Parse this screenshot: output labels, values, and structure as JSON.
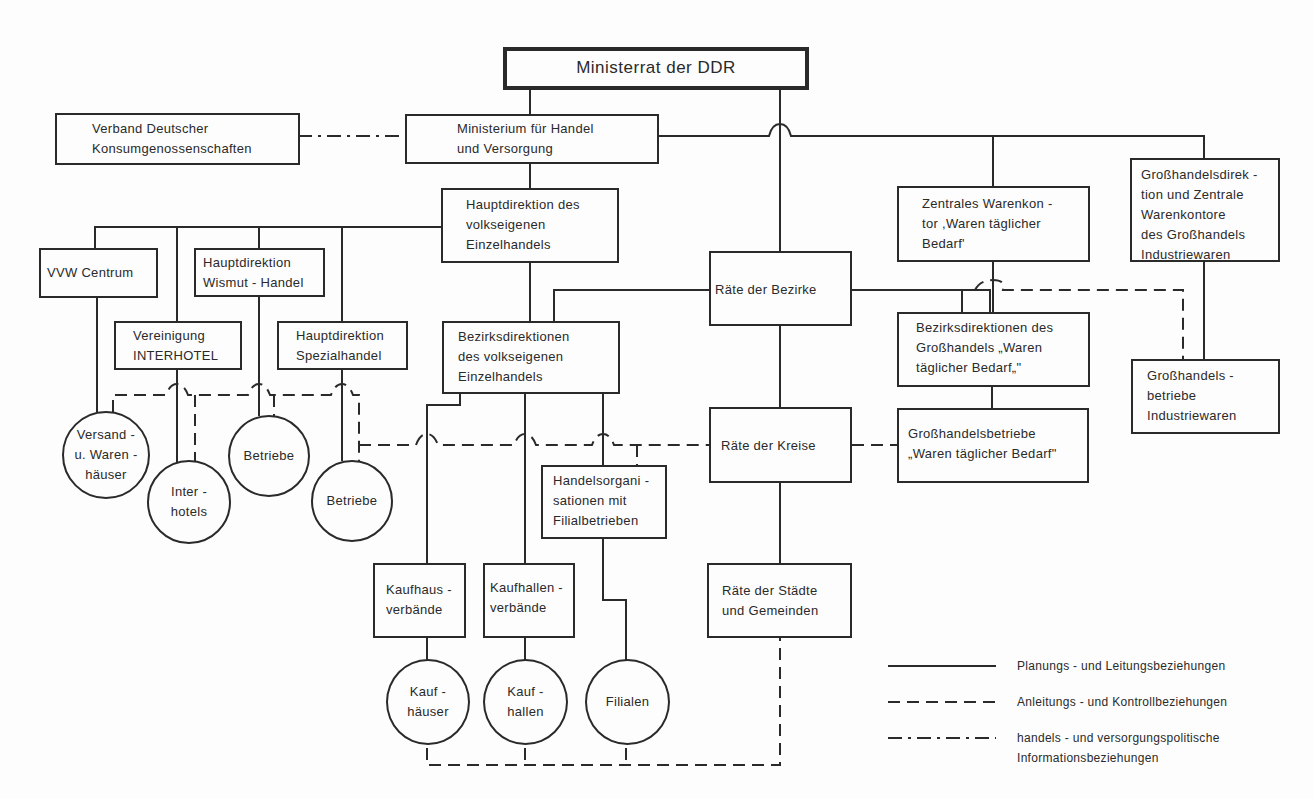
{
  "title": "Ministerrat der DDR",
  "nodes": {
    "ministerrat": "Ministerrat der DDR",
    "verband": "Verband Deutscher\nKonsumgenossenschaften",
    "ministerium": "Ministerium für Handel\nund Versorgung",
    "hauptdirektion_ve": "Hauptdirektion des\nvolkseigenen\nEinzelhandels",
    "vvw_centrum": "VVW Centrum",
    "hd_wismut": "Hauptdirektion\nWismut - Handel",
    "interhotel": "Vereinigung\nINTERHOTEL",
    "hd_spezial": "Hauptdirektion\nSpezialhandel",
    "bezirksdir_ve": "Bezirksdirektionen\ndes volkseigenen\nEinzelhandels",
    "raete_bezirke": "Räte der Bezirke",
    "raete_kreise": "Räte der Kreise",
    "raete_staedte": "Räte der Städte\nund Gemeinden",
    "zentrales_warenkontor": "Zentrales Warenkon -\ntor ,Waren täglicher\nBedarf'",
    "ghd_industrie": "Großhandelsdirek -\ntion und Zentrale\nWarenkontore\ndes Großhandels\nIndustriewaren",
    "bezirksdir_gh": "Bezirksdirektionen des\nGroßhandels „Waren\ntäglicher Bedarf„\"",
    "ghb_wtb": "Großhandelsbetriebe\n„Waren täglicher Bedarf\"",
    "ghb_industrie": "Großhandels -\nbetriebe\nIndustriewaren",
    "handelsorg": "Handelsorgani -\nsationen mit\nFilialbetrieben",
    "kaufhausverbaende": "Kaufhaus -\nverbände",
    "kaufhallenverbaende": "Kaufhallen -\nverbände"
  },
  "circles": {
    "versand": "Versand -\nu. Waren -\nhäuser",
    "interhotels": "Inter -\nhotels",
    "betriebe_wismut": "Betriebe",
    "betriebe_spezial": "Betriebe",
    "kaufhaeuser": "Kauf -\nhäuser",
    "kaufhallen": "Kauf -\nhallen",
    "filialen": "Filialen"
  },
  "legend": [
    {
      "style": "solid",
      "label": "Planungs - und Leitungsbeziehungen"
    },
    {
      "style": "dashed",
      "label": "Anleitungs - und Kontrollbeziehungen"
    },
    {
      "style": "dash-dot",
      "label": "handels - und versorgungspolitische\nInformationsbeziehungen"
    }
  ]
}
